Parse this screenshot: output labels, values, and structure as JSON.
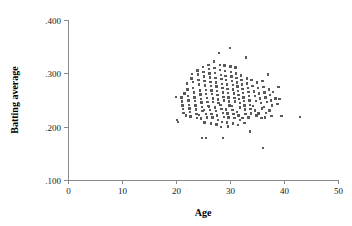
{
  "chart_data": {
    "type": "scatter",
    "title": "",
    "xlabel": "Age",
    "ylabel": "Batting average",
    "xlim": [
      0,
      50
    ],
    "ylim": [
      0.1,
      0.4
    ],
    "xticks": [
      0,
      10,
      20,
      30,
      40,
      50
    ],
    "xtick_labels": [
      "0",
      "10",
      "20",
      "30",
      "40",
      "50"
    ],
    "yticks": [
      0.1,
      0.2,
      0.3,
      0.4
    ],
    "ytick_labels": [
      ".100",
      ".200",
      ".300",
      ".400"
    ],
    "grid": false,
    "legend": null,
    "marker": "square",
    "marker_size_px": 2.4,
    "marker_color": "#59595b",
    "axis_color": "#8a8a8a",
    "series": [
      {
        "name": "players",
        "points": [
          [
            20.0,
            0.256
          ],
          [
            20.2,
            0.212
          ],
          [
            20.4,
            0.209
          ],
          [
            21.0,
            0.255
          ],
          [
            21.1,
            0.247
          ],
          [
            21.2,
            0.24
          ],
          [
            21.3,
            0.233
          ],
          [
            21.4,
            0.226
          ],
          [
            21.6,
            0.262
          ],
          [
            21.8,
            0.221
          ],
          [
            22.0,
            0.281
          ],
          [
            22.1,
            0.27
          ],
          [
            22.2,
            0.258
          ],
          [
            22.3,
            0.249
          ],
          [
            22.4,
            0.241
          ],
          [
            22.5,
            0.234
          ],
          [
            22.6,
            0.227
          ],
          [
            22.7,
            0.219
          ],
          [
            22.9,
            0.29
          ],
          [
            23.0,
            0.299
          ],
          [
            23.1,
            0.284
          ],
          [
            23.2,
            0.272
          ],
          [
            23.3,
            0.264
          ],
          [
            23.4,
            0.255
          ],
          [
            23.5,
            0.248
          ],
          [
            23.6,
            0.24
          ],
          [
            23.7,
            0.232
          ],
          [
            23.8,
            0.224
          ],
          [
            23.9,
            0.216
          ],
          [
            24.0,
            0.305
          ],
          [
            24.1,
            0.298
          ],
          [
            24.2,
            0.288
          ],
          [
            24.3,
            0.279
          ],
          [
            24.4,
            0.268
          ],
          [
            24.5,
            0.26
          ],
          [
            24.6,
            0.252
          ],
          [
            24.7,
            0.245
          ],
          [
            24.8,
            0.237
          ],
          [
            24.9,
            0.229
          ],
          [
            24.3,
            0.222
          ],
          [
            24.6,
            0.215
          ],
          [
            24.8,
            0.179
          ],
          [
            25.0,
            0.312
          ],
          [
            25.1,
            0.303
          ],
          [
            25.2,
            0.294
          ],
          [
            25.3,
            0.286
          ],
          [
            25.4,
            0.277
          ],
          [
            25.5,
            0.269
          ],
          [
            25.6,
            0.261
          ],
          [
            25.7,
            0.254
          ],
          [
            25.8,
            0.246
          ],
          [
            25.9,
            0.239
          ],
          [
            25.2,
            0.231
          ],
          [
            25.5,
            0.224
          ],
          [
            25.7,
            0.217
          ],
          [
            25.3,
            0.208
          ],
          [
            25.6,
            0.179
          ],
          [
            26.0,
            0.316
          ],
          [
            26.1,
            0.308
          ],
          [
            26.2,
            0.3
          ],
          [
            26.3,
            0.292
          ],
          [
            26.4,
            0.284
          ],
          [
            26.5,
            0.276
          ],
          [
            26.6,
            0.268
          ],
          [
            26.7,
            0.261
          ],
          [
            26.8,
            0.253
          ],
          [
            26.9,
            0.246
          ],
          [
            26.15,
            0.238
          ],
          [
            26.35,
            0.231
          ],
          [
            26.55,
            0.224
          ],
          [
            26.75,
            0.217
          ],
          [
            26.45,
            0.206
          ],
          [
            27.0,
            0.322
          ],
          [
            27.1,
            0.31
          ],
          [
            27.2,
            0.301
          ],
          [
            27.3,
            0.291
          ],
          [
            27.4,
            0.283
          ],
          [
            27.5,
            0.275
          ],
          [
            27.6,
            0.267
          ],
          [
            27.7,
            0.259
          ],
          [
            27.8,
            0.251
          ],
          [
            27.9,
            0.244
          ],
          [
            27.2,
            0.236
          ],
          [
            27.4,
            0.229
          ],
          [
            27.6,
            0.221
          ],
          [
            27.8,
            0.213
          ],
          [
            27.5,
            0.204
          ],
          [
            28.0,
            0.338
          ],
          [
            28.1,
            0.316
          ],
          [
            28.2,
            0.306
          ],
          [
            28.3,
            0.297
          ],
          [
            28.4,
            0.289
          ],
          [
            28.5,
            0.28
          ],
          [
            28.6,
            0.272
          ],
          [
            28.7,
            0.264
          ],
          [
            28.8,
            0.256
          ],
          [
            28.9,
            0.249
          ],
          [
            28.25,
            0.241
          ],
          [
            28.45,
            0.233
          ],
          [
            28.65,
            0.226
          ],
          [
            28.85,
            0.218
          ],
          [
            28.55,
            0.209
          ],
          [
            28.35,
            0.199
          ],
          [
            28.7,
            0.179
          ],
          [
            29.0,
            0.315
          ],
          [
            29.1,
            0.304
          ],
          [
            29.2,
            0.295
          ],
          [
            29.3,
            0.287
          ],
          [
            29.4,
            0.279
          ],
          [
            29.5,
            0.271
          ],
          [
            29.6,
            0.263
          ],
          [
            29.7,
            0.255
          ],
          [
            29.8,
            0.247
          ],
          [
            29.9,
            0.24
          ],
          [
            29.25,
            0.232
          ],
          [
            29.5,
            0.225
          ],
          [
            29.75,
            0.217
          ],
          [
            29.4,
            0.208
          ],
          [
            29.6,
            0.2
          ],
          [
            30.0,
            0.348
          ],
          [
            30.1,
            0.313
          ],
          [
            30.2,
            0.303
          ],
          [
            30.3,
            0.294
          ],
          [
            30.4,
            0.286
          ],
          [
            30.5,
            0.278
          ],
          [
            30.6,
            0.27
          ],
          [
            30.7,
            0.262
          ],
          [
            30.8,
            0.254
          ],
          [
            30.9,
            0.247
          ],
          [
            30.25,
            0.239
          ],
          [
            30.45,
            0.231
          ],
          [
            30.65,
            0.224
          ],
          [
            30.85,
            0.216
          ],
          [
            30.55,
            0.206
          ],
          [
            31.0,
            0.311
          ],
          [
            31.1,
            0.3
          ],
          [
            31.2,
            0.291
          ],
          [
            31.3,
            0.283
          ],
          [
            31.4,
            0.275
          ],
          [
            31.5,
            0.267
          ],
          [
            31.6,
            0.259
          ],
          [
            31.7,
            0.252
          ],
          [
            31.8,
            0.244
          ],
          [
            31.9,
            0.236
          ],
          [
            31.3,
            0.228
          ],
          [
            31.6,
            0.221
          ],
          [
            31.85,
            0.213
          ],
          [
            31.45,
            0.203
          ],
          [
            32.0,
            0.296
          ],
          [
            32.1,
            0.287
          ],
          [
            32.2,
            0.279
          ],
          [
            32.3,
            0.271
          ],
          [
            32.4,
            0.263
          ],
          [
            32.5,
            0.255
          ],
          [
            32.6,
            0.248
          ],
          [
            32.7,
            0.24
          ],
          [
            32.8,
            0.232
          ],
          [
            32.9,
            0.224
          ],
          [
            32.35,
            0.216
          ],
          [
            32.65,
            0.207
          ],
          [
            33.0,
            0.33
          ],
          [
            33.1,
            0.29
          ],
          [
            33.2,
            0.281
          ],
          [
            33.3,
            0.273
          ],
          [
            33.4,
            0.265
          ],
          [
            33.5,
            0.257
          ],
          [
            33.6,
            0.249
          ],
          [
            33.7,
            0.241
          ],
          [
            33.8,
            0.233
          ],
          [
            33.9,
            0.225
          ],
          [
            33.4,
            0.217
          ],
          [
            33.7,
            0.191
          ],
          [
            34.0,
            0.288
          ],
          [
            34.2,
            0.276
          ],
          [
            34.4,
            0.266
          ],
          [
            34.6,
            0.257
          ],
          [
            34.8,
            0.248
          ],
          [
            34.3,
            0.239
          ],
          [
            34.6,
            0.23
          ],
          [
            34.9,
            0.221
          ],
          [
            35.0,
            0.283
          ],
          [
            35.2,
            0.272
          ],
          [
            35.4,
            0.262
          ],
          [
            35.5,
            0.253
          ],
          [
            35.7,
            0.244
          ],
          [
            35.9,
            0.234
          ],
          [
            35.3,
            0.225
          ],
          [
            35.8,
            0.216
          ],
          [
            36.0,
            0.286
          ],
          [
            36.2,
            0.274
          ],
          [
            36.4,
            0.264
          ],
          [
            36.6,
            0.255
          ],
          [
            36.8,
            0.246
          ],
          [
            36.3,
            0.237
          ],
          [
            36.7,
            0.226
          ],
          [
            36.5,
            0.217
          ],
          [
            36.1,
            0.16
          ],
          [
            37.0,
            0.298
          ],
          [
            37.2,
            0.27
          ],
          [
            37.4,
            0.259
          ],
          [
            37.6,
            0.249
          ],
          [
            37.8,
            0.24
          ],
          [
            37.3,
            0.23
          ],
          [
            37.7,
            0.22
          ],
          [
            38.0,
            0.265
          ],
          [
            38.4,
            0.253
          ],
          [
            38.8,
            0.242
          ],
          [
            39.0,
            0.274
          ],
          [
            39.2,
            0.252
          ],
          [
            39.5,
            0.22
          ],
          [
            43.0,
            0.218
          ]
        ]
      }
    ]
  },
  "layout": {
    "plot_left_px": 68,
    "plot_right_px": 338,
    "plot_top_px": 20,
    "plot_bottom_px": 180
  }
}
